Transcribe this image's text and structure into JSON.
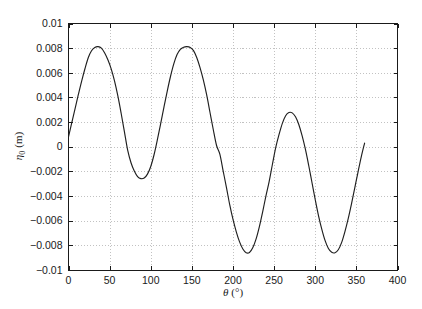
{
  "chart_data": {
    "type": "line",
    "title": "",
    "subtitle": "",
    "xlabel": "θ (°)",
    "ylabel": "η₀ (m)",
    "xlabel_symbol": "θ",
    "xlabel_units": "(°)",
    "ylabel_symbol": "η",
    "ylabel_subscript": "0",
    "ylabel_units": "(m)",
    "xlim": [
      0,
      400
    ],
    "ylim": [
      -0.01,
      0.01
    ],
    "xticks": [
      0,
      50,
      100,
      150,
      200,
      250,
      300,
      350,
      400
    ],
    "xticklabels": [
      "0",
      "50",
      "100",
      "150",
      "200",
      "250",
      "300",
      "350",
      "400"
    ],
    "yticks": [
      -0.01,
      -0.008,
      -0.006,
      -0.004,
      -0.002,
      0,
      0.002,
      0.004,
      0.006,
      0.008,
      0.01
    ],
    "yticklabels": [
      "−0.01",
      "−0.008",
      "−0.006",
      "−0.004",
      "−0.002",
      "0",
      "0.002",
      "0.004",
      "0.006",
      "0.008",
      "0.01"
    ],
    "grid": true,
    "grid_style": "dotted",
    "legend": null,
    "line_color": "#1f1f1f",
    "background_color": "#ffffff",
    "axis_color": "#1a1a1a",
    "annotations": [],
    "features": {
      "peaks": [
        {
          "x": 35,
          "y": 0.0081
        },
        {
          "x": 146,
          "y": 0.0081
        },
        {
          "x": 269,
          "y": 0.0028
        }
      ],
      "troughs": [
        {
          "x": 90,
          "y": -0.0026
        },
        {
          "x": 215,
          "y": -0.0086
        },
        {
          "x": 325,
          "y": -0.0086
        }
      ],
      "start_point": {
        "x": 0,
        "y": 0.0008
      },
      "end_point": {
        "x": 360,
        "y": 0.0003
      },
      "zero_crossings": [
        63,
        117,
        183,
        249,
        288,
        357
      ]
    },
    "x": [
      0,
      4,
      8,
      12,
      16,
      20,
      24,
      28,
      32,
      36,
      40,
      44,
      48,
      52,
      56,
      60,
      64,
      68,
      72,
      76,
      80,
      84,
      88,
      92,
      96,
      100,
      104,
      108,
      112,
      116,
      120,
      124,
      128,
      132,
      136,
      140,
      144,
      148,
      152,
      156,
      160,
      164,
      168,
      172,
      176,
      180,
      184,
      188,
      192,
      196,
      200,
      204,
      208,
      212,
      216,
      220,
      224,
      228,
      232,
      236,
      240,
      244,
      248,
      252,
      256,
      260,
      264,
      268,
      272,
      276,
      280,
      284,
      288,
      292,
      296,
      300,
      304,
      308,
      312,
      316,
      320,
      324,
      328,
      332,
      336,
      340,
      344,
      348,
      352,
      356,
      360
    ],
    "y": [
      0.0008,
      0.00195,
      0.0031,
      0.00424,
      0.00533,
      0.00633,
      0.00722,
      0.00779,
      0.00806,
      0.00812,
      0.008,
      0.00761,
      0.00704,
      0.0063,
      0.00532,
      0.00412,
      0.00272,
      0.00121,
      -0.0003,
      -0.0013,
      -0.00197,
      -0.00242,
      -0.00259,
      -0.00254,
      -0.00222,
      -0.0016,
      -0.00065,
      0.00055,
      0.00185,
      0.0032,
      0.0045,
      0.0057,
      0.00672,
      0.00748,
      0.0079,
      0.00808,
      0.00812,
      0.00806,
      0.0078,
      0.00722,
      0.0064,
      0.0054,
      0.0042,
      0.0028,
      0.0014,
      0.0001,
      -0.0006,
      -0.00195,
      -0.0033,
      -0.0047,
      -0.0059,
      -0.0069,
      -0.00772,
      -0.0083,
      -0.0086,
      -0.00858,
      -0.0082,
      -0.0075,
      -0.0065,
      -0.0053,
      -0.004,
      -0.0028,
      -0.0014,
      -5e-05,
      0.001,
      0.0019,
      0.00252,
      0.00278,
      0.00275,
      0.00243,
      0.0018,
      0.0009,
      -0.0002,
      -0.0015,
      -0.0029,
      -0.0043,
      -0.0056,
      -0.0067,
      -0.00762,
      -0.00826,
      -0.00856,
      -0.0086,
      -0.00836,
      -0.00778,
      -0.0069,
      -0.00585,
      -0.00465,
      -0.00335,
      -0.00205,
      -0.0008,
      0.0003
    ]
  }
}
